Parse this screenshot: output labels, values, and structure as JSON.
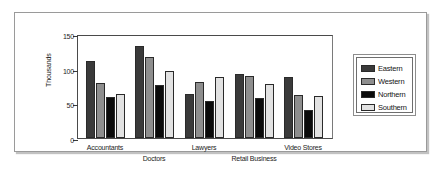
{
  "chart_data": {
    "type": "bar",
    "title": "",
    "xlabel": "",
    "ylabel": "Thousands",
    "ylim": [
      0,
      150
    ],
    "yticks": [
      0,
      50,
      100,
      150
    ],
    "ytick_labels": [
      "0",
      "50",
      "100",
      "150"
    ],
    "grid": false,
    "legend_position": "right",
    "categories": [
      "Accountants",
      "Doctors",
      "Lawyers",
      "Retail Business",
      "Video Stores"
    ],
    "series": [
      {
        "name": "Eastern",
        "color": "#3a3a3a",
        "values": [
          111,
          132,
          63,
          93,
          88
        ]
      },
      {
        "name": "Western",
        "color": "#8e8e8e",
        "values": [
          80,
          117,
          81,
          89,
          62
        ]
      },
      {
        "name": "Northern",
        "color": "#0b0b0b",
        "values": [
          59,
          77,
          53,
          58,
          41
        ]
      },
      {
        "name": "Southern",
        "color": "#e2e2e2",
        "values": [
          63,
          96,
          88,
          78,
          61
        ]
      }
    ]
  },
  "legend": {
    "items": [
      {
        "label": "Eastern"
      },
      {
        "label": "Western"
      },
      {
        "label": "Northern"
      },
      {
        "label": "Southern"
      }
    ]
  }
}
